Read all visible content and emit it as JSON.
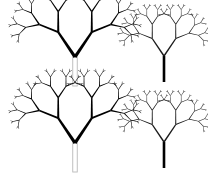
{
  "figure": {
    "background_color": "#ffffff",
    "width": 208,
    "height": 175,
    "layout": "2x2 grid of fractal trees",
    "panel_count": 4
  },
  "palette": {
    "branch_dark": "#000000",
    "branch_mid": "#3a3a3a",
    "branch_thin": "#1a1a1a",
    "trunk_hollow_stroke": "#b9b9b9",
    "trunk_solid": "#000000",
    "background": "#ffffff"
  },
  "trees": [
    {
      "id": "tree-top-left",
      "name": "large-tree-top-left",
      "size_class": "large",
      "trunk_style": "hollow-outline",
      "trunk_color": "#b9b9b9",
      "trunk_width": 4.5,
      "branch_color": "#000000",
      "origin_x": 75,
      "origin_y": 86,
      "trunk_top_y": 57,
      "depth": 5,
      "base_length": 30,
      "length_ratio": 0.68,
      "branch_angle_deg": 34,
      "base_width": 3.2,
      "width_ratio": 0.66,
      "tip_weight": "heavy",
      "canopy_span": [
        14,
        124
      ],
      "canopy_top_y": 10
    },
    {
      "id": "tree-top-right",
      "name": "small-tree-top-right",
      "size_class": "small",
      "trunk_style": "solid",
      "trunk_color": "#000000",
      "trunk_width": 2.6,
      "branch_color": "#1a1a1a",
      "origin_x": 164,
      "origin_y": 82,
      "trunk_top_y": 56,
      "depth": 5,
      "base_length": 21,
      "length_ratio": 0.68,
      "branch_angle_deg": 34,
      "base_width": 1.5,
      "width_ratio": 0.72,
      "tip_weight": "light",
      "canopy_span": [
        128,
        200
      ],
      "canopy_top_y": 26
    },
    {
      "id": "tree-bottom-left",
      "name": "large-tree-bottom-left",
      "size_class": "large",
      "trunk_style": "hollow-outline",
      "trunk_color": "#b9b9b9",
      "trunk_width": 4.5,
      "branch_color": "#000000",
      "origin_x": 75,
      "origin_y": 172,
      "trunk_top_y": 143,
      "depth": 5,
      "base_length": 30,
      "length_ratio": 0.68,
      "branch_angle_deg": 34,
      "base_width": 3.2,
      "width_ratio": 0.66,
      "tip_weight": "heavy",
      "canopy_span": [
        14,
        124
      ],
      "canopy_top_y": 96
    },
    {
      "id": "tree-bottom-right",
      "name": "small-tree-bottom-right",
      "size_class": "small",
      "trunk_style": "solid",
      "trunk_color": "#000000",
      "trunk_width": 2.6,
      "branch_color": "#1a1a1a",
      "origin_x": 164,
      "origin_y": 168,
      "trunk_top_y": 142,
      "depth": 5,
      "base_length": 21,
      "length_ratio": 0.68,
      "branch_angle_deg": 34,
      "base_width": 1.5,
      "width_ratio": 0.72,
      "tip_weight": "light",
      "canopy_span": [
        128,
        200
      ],
      "canopy_top_y": 112
    }
  ]
}
